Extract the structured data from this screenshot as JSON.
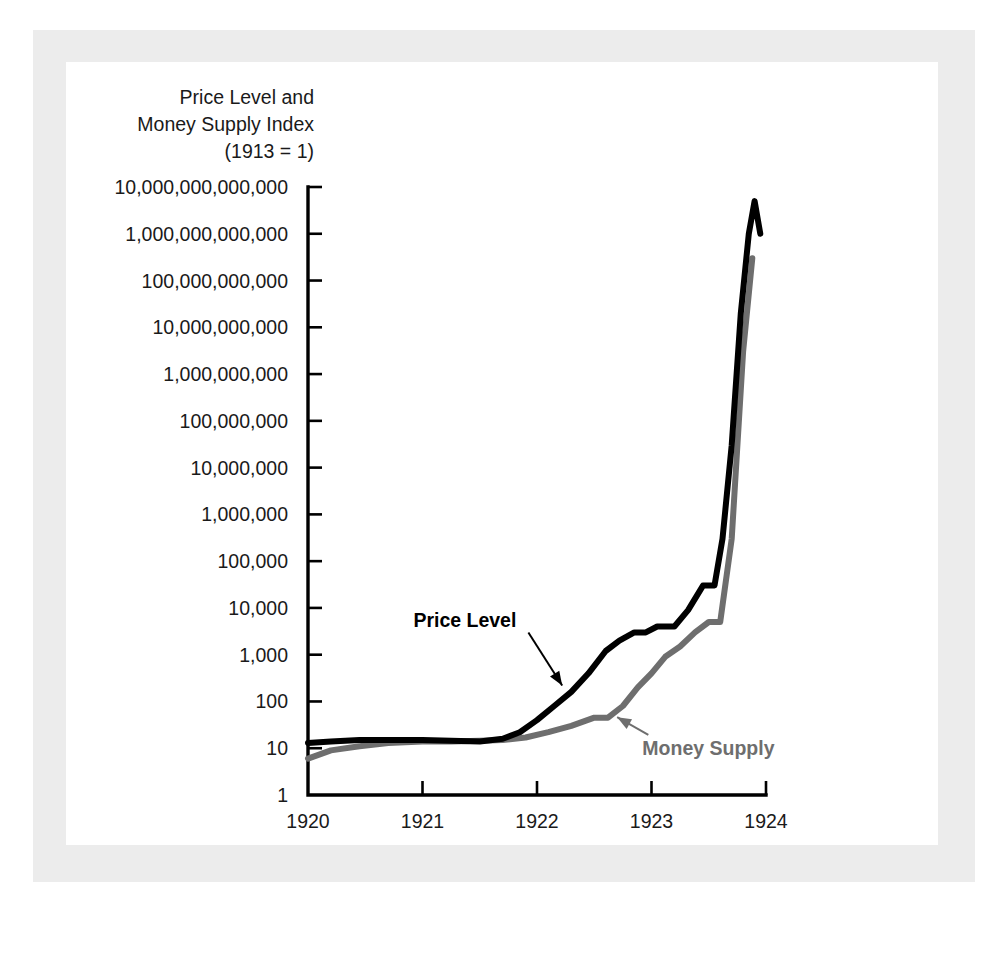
{
  "figure": {
    "axis_title": "Price Level and\nMoney Supply Index\n(1913 = 1)",
    "price_label": "Price Level",
    "money_label": "Money Supply",
    "price_color": "#000000",
    "money_color": "#6e6e6e",
    "mat_color": "#ececec",
    "plate_color": "#ffffff"
  },
  "chart_data": {
    "type": "line",
    "title": "Price Level and Money Supply Index (1913 = 1)",
    "xlabel": "",
    "ylabel": "Price Level and Money Supply Index (1913 = 1)",
    "yscale": "log",
    "ylim": [
      1,
      10000000000000
    ],
    "xlim": [
      1920,
      1924
    ],
    "grid": false,
    "legend": "annotations-on-curves",
    "ytick_labels": [
      "10,000,000,000,000",
      "1,000,000,000,000",
      "100,000,000,000",
      "10,000,000,000",
      "1,000,000,000",
      "100,000,000",
      "10,000,000",
      "1,000,000",
      "100,000",
      "10,000",
      "1,000",
      "100",
      "10",
      "1"
    ],
    "ytick_values": [
      10000000000000.0,
      1000000000000.0,
      100000000000.0,
      10000000000.0,
      1000000000.0,
      100000000.0,
      10000000.0,
      1000000.0,
      100000.0,
      10000.0,
      1000,
      100,
      10,
      1
    ],
    "xtick_labels": [
      "1920",
      "1921",
      "1922",
      "1923",
      "1924"
    ],
    "xtick_values": [
      1920,
      1921,
      1922,
      1923,
      1924
    ],
    "series": [
      {
        "name": "Price Level",
        "color": "#000000",
        "x": [
          1920.0,
          1920.2,
          1920.45,
          1920.7,
          1921.0,
          1921.25,
          1921.5,
          1921.7,
          1921.85,
          1922.0,
          1922.15,
          1922.3,
          1922.45,
          1922.6,
          1922.72,
          1922.85,
          1922.95,
          1923.05,
          1923.2,
          1923.32,
          1923.45,
          1923.55,
          1923.62,
          1923.7,
          1923.78,
          1923.85,
          1923.9,
          1923.95
        ],
        "y": [
          13,
          14,
          15,
          15,
          15,
          14.5,
          14,
          16,
          22,
          40,
          80,
          160,
          400,
          1200,
          2000,
          3000,
          3000,
          4000,
          4000,
          9000,
          30000,
          30000,
          300000,
          30000000,
          20000000000,
          1000000000000,
          5000000000000,
          1000000000000
        ]
      },
      {
        "name": "Money Supply",
        "color": "#6e6e6e",
        "x": [
          1920.0,
          1920.2,
          1920.45,
          1920.7,
          1921.0,
          1921.25,
          1921.5,
          1921.7,
          1921.9,
          1922.1,
          1922.3,
          1922.5,
          1922.62,
          1922.75,
          1922.88,
          1923.0,
          1923.12,
          1923.25,
          1923.38,
          1923.5,
          1923.6,
          1923.7,
          1923.8,
          1923.88
        ],
        "y": [
          6,
          9,
          11,
          13,
          14,
          14,
          14.5,
          15,
          17,
          22,
          30,
          45,
          45,
          80,
          200,
          400,
          900,
          1500,
          3000,
          5000,
          5000,
          300000,
          3000000000,
          300000000000
        ]
      }
    ],
    "annotations": [
      {
        "text": "Price Level",
        "series": "Price Level",
        "color": "#000000"
      },
      {
        "text": "Money Supply",
        "series": "Money Supply",
        "color": "#6e6e6e"
      }
    ]
  }
}
